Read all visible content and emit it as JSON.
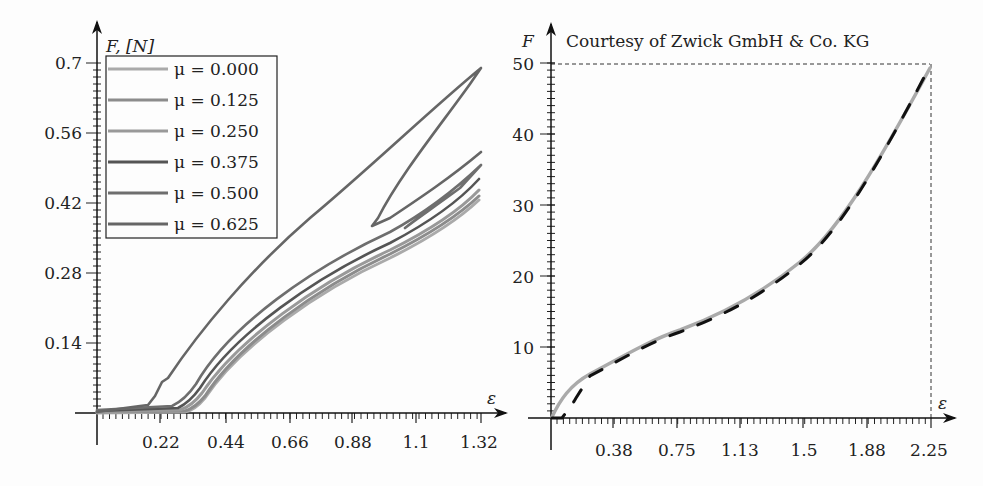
{
  "chart_data": [
    {
      "type": "line",
      "title": "",
      "xlabel": "ε",
      "ylabel": "F, [N]",
      "xlim": [
        0,
        1.32
      ],
      "ylim": [
        0,
        0.7
      ],
      "x_ticks": [
        "0.22",
        "0.44",
        "0.66",
        "0.88",
        "1.1",
        "1.32"
      ],
      "y_ticks": [
        "0.14",
        "0.28",
        "0.42",
        "0.56",
        "0.7"
      ],
      "grid": false,
      "legend_position": "upper left",
      "series": [
        {
          "name": "μ = 0.000",
          "color": "#aaaaaa",
          "x": [
            0,
            0.3,
            0.5,
            0.8,
            1.1,
            1.32
          ],
          "y": [
            0,
            0,
            0.15,
            0.3,
            0.43,
            0.51
          ]
        },
        {
          "name": "μ = 0.125",
          "color": "#8c8c8c",
          "x": [
            0,
            0.3,
            0.5,
            0.8,
            1.1,
            1.32
          ],
          "y": [
            0,
            0,
            0.155,
            0.31,
            0.44,
            0.52
          ]
        },
        {
          "name": "μ = 0.250",
          "color": "#999999",
          "x": [
            0,
            0.28,
            0.5,
            0.8,
            1.1,
            1.32
          ],
          "y": [
            0,
            0.005,
            0.16,
            0.32,
            0.45,
            0.53
          ]
        },
        {
          "name": "μ = 0.375",
          "color": "#555555",
          "x": [
            0,
            0.27,
            0.5,
            0.8,
            1.1,
            1.32
          ],
          "y": [
            0,
            0.01,
            0.17,
            0.33,
            0.46,
            0.545
          ]
        },
        {
          "name": "μ = 0.500",
          "color": "#6e6e6e",
          "x": [
            0,
            0.25,
            0.5,
            0.8,
            1.1,
            1.32
          ],
          "y": [
            0,
            0.015,
            0.185,
            0.35,
            0.48,
            0.57
          ]
        },
        {
          "name": "μ = 0.625",
          "color": "#666666",
          "x": [
            0,
            0.15,
            0.22,
            0.44,
            0.66,
            0.88,
            1.1,
            1.32,
            0.92
          ],
          "y": [
            0,
            0.02,
            0.07,
            0.22,
            0.36,
            0.47,
            0.58,
            0.69,
            0.38
          ]
        }
      ]
    },
    {
      "type": "line",
      "title": "",
      "annotation": "Courtesy of Zwick GmbH & Co. KG",
      "xlabel": "ε",
      "ylabel": "F",
      "xlim": [
        0,
        2.25
      ],
      "ylim": [
        0,
        50
      ],
      "x_ticks": [
        "0.38",
        "0.75",
        "1.13",
        "1.5",
        "1.88",
        "2.25"
      ],
      "y_ticks": [
        "10",
        "20",
        "30",
        "40",
        "50"
      ],
      "grid": false,
      "reference_lines": {
        "x": 2.25,
        "y": 50,
        "style": "dashed"
      },
      "series": [
        {
          "name": "experiment",
          "color": "#aaaaaa",
          "style": "solid",
          "x": [
            0,
            0.1,
            0.2,
            0.38,
            0.5,
            0.75,
            1.0,
            1.13,
            1.5,
            1.88,
            2.1,
            2.25
          ],
          "y": [
            0,
            4,
            6.5,
            9,
            10.5,
            13.5,
            17.5,
            20,
            27,
            36,
            43,
            49.5
          ]
        },
        {
          "name": "simulation",
          "color": "#111111",
          "style": "dashed",
          "x": [
            0,
            0.06,
            0.12,
            0.2,
            0.38,
            0.5,
            0.75,
            1.0,
            1.13,
            1.5,
            1.88,
            2.1,
            2.25
          ],
          "y": [
            0,
            0,
            2.5,
            6.5,
            9.2,
            10.8,
            13.8,
            17.8,
            20.2,
            27.2,
            36.2,
            43.2,
            50
          ]
        }
      ]
    }
  ],
  "left_chart": {
    "y_label": "F, [N]",
    "x_label": "ε",
    "y_ticks": [
      "0.7",
      "0.56",
      "0.42",
      "0.28",
      "0.14"
    ],
    "x_ticks": [
      "0.22",
      "0.44",
      "0.66",
      "0.88",
      "1.1",
      "1.32"
    ],
    "legend": [
      {
        "label": "μ = 0.000",
        "color": "#aaaaaa"
      },
      {
        "label": "μ = 0.125",
        "color": "#8c8c8c"
      },
      {
        "label": "μ = 0.250",
        "color": "#999999"
      },
      {
        "label": "μ = 0.375",
        "color": "#555555"
      },
      {
        "label": "μ = 0.500",
        "color": "#6e6e6e"
      },
      {
        "label": "μ = 0.625",
        "color": "#666666"
      }
    ]
  },
  "right_chart": {
    "y_label": "F",
    "x_label": "ε",
    "note": "Courtesy of Zwick GmbH & Co. KG",
    "y_ticks": [
      "50",
      "40",
      "30",
      "20",
      "10"
    ],
    "x_ticks": [
      "0.38",
      "0.75",
      "1.13",
      "1.5",
      "1.88",
      "2.25"
    ]
  }
}
